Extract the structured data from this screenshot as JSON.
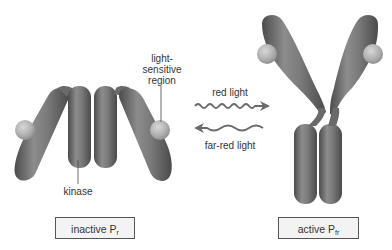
{
  "diagram": {
    "inactive": {
      "label_main": "inactive P",
      "label_sub": "r",
      "annotations": {
        "light_sensitive": [
          "light-",
          "sensitive",
          "region"
        ],
        "kinase": "kinase"
      }
    },
    "active": {
      "label_main": "active P",
      "label_sub": "fr"
    },
    "arrows": {
      "forward": {
        "label": "red light",
        "direction": "right"
      },
      "reverse": {
        "label": "far-red light",
        "direction": "left"
      }
    },
    "colors": {
      "protein": "#6e6e6e",
      "protein_highlight": "#9a9a9a",
      "chromophore": "#b8b8b8",
      "arrow": "#6a6a6a",
      "box_border": "#555555",
      "box_fill": "#f3f3f3"
    }
  }
}
